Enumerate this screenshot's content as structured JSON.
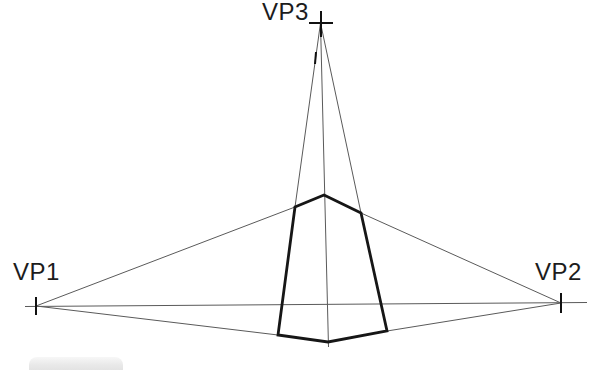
{
  "figure": {
    "type": "three-point-perspective-construction",
    "labels": {
      "vp1": "VP1",
      "vp2": "VP2",
      "vp3": "VP3"
    },
    "colors": {
      "background": "#ffffff",
      "thin_line": "#5a5a5a",
      "thick_line": "#161616",
      "tick": "#111111",
      "label_text": "#1c1c1c"
    },
    "geometry": {
      "vanishing_points": {
        "vp1": [
          36,
          306
        ],
        "vp2": [
          561,
          303
        ],
        "vp3": [
          320.5,
          23
        ]
      },
      "box_vertices": {
        "top": [
          324,
          195
        ],
        "top_right": [
          361,
          213
        ],
        "bottom_right": [
          387,
          331
        ],
        "bottom": [
          328,
          342
        ],
        "bottom_left": [
          278,
          335
        ],
        "top_left": [
          295,
          207
        ]
      },
      "thin_lines": [
        {
          "name": "horizon-line",
          "pts": [
            25,
            306.5,
            587,
            302.5
          ]
        },
        {
          "name": "vp1-to-box-top-left",
          "pts": [
            36,
            306,
            295,
            207
          ]
        },
        {
          "name": "vp1-to-box-bottom-left",
          "pts": [
            36,
            306,
            278,
            335
          ]
        },
        {
          "name": "vp2-to-box-top-right",
          "pts": [
            561,
            303,
            361,
            213
          ]
        },
        {
          "name": "vp2-to-box-bottom-right",
          "pts": [
            561,
            303,
            387,
            331
          ]
        },
        {
          "name": "vp3-to-box-top-left",
          "pts": [
            320.5,
            23,
            295,
            207
          ]
        },
        {
          "name": "vp3-to-box-top-right",
          "pts": [
            320.5,
            23,
            361,
            213
          ]
        },
        {
          "name": "vp3-center-axis",
          "pts": [
            320.5,
            23,
            328.5,
            347
          ]
        }
      ],
      "box_outline": [
        324,
        195,
        361,
        213,
        387,
        331,
        328,
        342,
        278,
        335,
        295,
        207
      ],
      "ticks": [
        {
          "name": "vp1-tick-mark",
          "pts": [
            36,
            297,
            36,
            315
          ]
        },
        {
          "name": "vp2-tick-mark",
          "pts": [
            561,
            293,
            561,
            313
          ]
        },
        {
          "name": "vp3-tick-mark-vertical",
          "pts": [
            321,
            11,
            321,
            37
          ]
        },
        {
          "name": "vp3-tick-mark-horizontal",
          "pts": [
            309,
            23,
            333,
            23
          ]
        },
        {
          "name": "left-line-blemish",
          "pts": [
            316,
            52,
            315,
            64
          ]
        }
      ]
    }
  }
}
